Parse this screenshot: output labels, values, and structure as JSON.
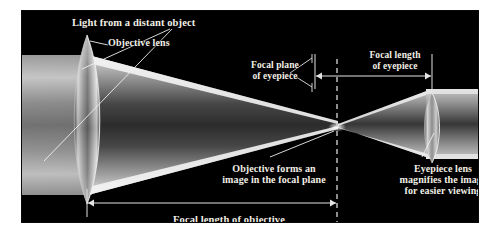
{
  "figure": {
    "background": "#ffffff",
    "panel_color": "#000000",
    "text_color": "#f2efe6"
  },
  "labels": {
    "light_source": "Light from a distant object",
    "objective_lens": "Objective lens",
    "focal_plane_eyepiece_line1": "Focal plane",
    "focal_plane_eyepiece_line2": "of eyepiece",
    "focal_length_eyepiece_line1": "Focal length",
    "focal_length_eyepiece_line2": "of eyepiece",
    "objective_forms_line1": "Objective forms an",
    "objective_forms_line2": "image in the focal plane",
    "eyepiece_magnifies_line1": "Eyepiece lens",
    "eyepiece_magnifies_line2": "magnifies the image",
    "eyepiece_magnifies_line3": "for easier viewing",
    "focal_length_objective": "Focal length of objective"
  },
  "optics": {
    "objective_lens_name": "objective-lens",
    "eyepiece_lens_name": "eyepiece-lens",
    "focal_point_name": "focal-point",
    "dashed_line_name": "focal-plane-dashed-line",
    "incoming_beam_name": "incoming-parallel-light-beam",
    "converging_beam_name": "converging-light-cone",
    "exiting_beam_name": "exiting-light-beam"
  },
  "measurements": {
    "focal_length_objective_arrow": "double-headed-arrow",
    "focal_length_eyepiece_arrow": "double-headed-arrow"
  }
}
